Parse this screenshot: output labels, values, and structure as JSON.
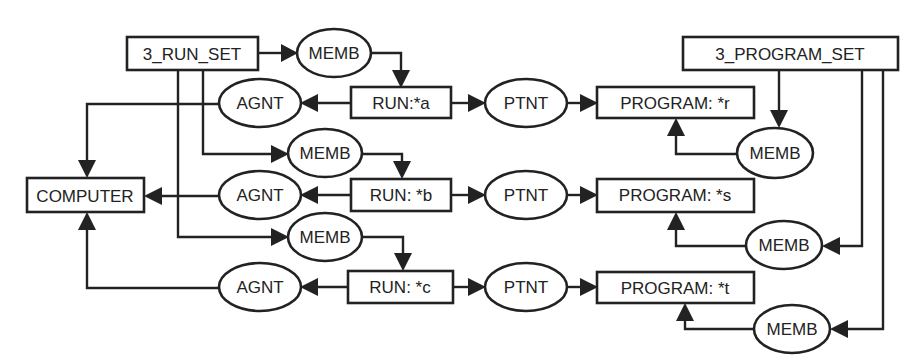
{
  "diagram": {
    "type": "conceptual-graph",
    "colors": {
      "ink": "#222222",
      "background": "#ffffff"
    },
    "concepts": {
      "run_set": "3_RUN_SET",
      "program_set": "3_PROGRAM_SET",
      "computer": "COMPUTER",
      "run_a": "RUN:*a",
      "run_b": "RUN: *b",
      "run_c": "RUN: *c",
      "program_r": "PROGRAM: *r",
      "program_s": "PROGRAM: *s",
      "program_t": "PROGRAM: *t"
    },
    "relations": {
      "memb_run_a": "MEMB",
      "memb_run_b": "MEMB",
      "memb_run_c": "MEMB",
      "agnt_a": "AGNT",
      "agnt_b": "AGNT",
      "agnt_c": "AGNT",
      "ptnt_a": "PTNT",
      "ptnt_b": "PTNT",
      "ptnt_c": "PTNT",
      "memb_prog_r": "MEMB",
      "memb_prog_s": "MEMB",
      "memb_prog_t": "MEMB"
    },
    "edges": [
      {
        "from": "3_RUN_SET",
        "to": "MEMB(a)"
      },
      {
        "from": "MEMB(a)",
        "to": "RUN:*a"
      },
      {
        "from": "3_RUN_SET",
        "to": "MEMB(b)"
      },
      {
        "from": "MEMB(b)",
        "to": "RUN: *b"
      },
      {
        "from": "3_RUN_SET",
        "to": "MEMB(c)"
      },
      {
        "from": "MEMB(c)",
        "to": "RUN: *c"
      },
      {
        "from": "RUN:*a",
        "to": "AGNT(a)"
      },
      {
        "from": "AGNT(a)",
        "to": "COMPUTER"
      },
      {
        "from": "RUN: *b",
        "to": "AGNT(b)"
      },
      {
        "from": "AGNT(b)",
        "to": "COMPUTER"
      },
      {
        "from": "RUN: *c",
        "to": "AGNT(c)"
      },
      {
        "from": "AGNT(c)",
        "to": "COMPUTER"
      },
      {
        "from": "RUN:*a",
        "to": "PTNT(a)"
      },
      {
        "from": "PTNT(a)",
        "to": "PROGRAM: *r"
      },
      {
        "from": "RUN: *b",
        "to": "PTNT(b)"
      },
      {
        "from": "PTNT(b)",
        "to": "PROGRAM: *s"
      },
      {
        "from": "RUN: *c",
        "to": "PTNT(c)"
      },
      {
        "from": "PTNT(c)",
        "to": "PROGRAM: *t"
      },
      {
        "from": "3_PROGRAM_SET",
        "to": "MEMB(r)"
      },
      {
        "from": "MEMB(r)",
        "to": "PROGRAM: *r"
      },
      {
        "from": "3_PROGRAM_SET",
        "to": "MEMB(s)"
      },
      {
        "from": "MEMB(s)",
        "to": "PROGRAM: *s"
      },
      {
        "from": "3_PROGRAM_SET",
        "to": "MEMB(t)"
      },
      {
        "from": "MEMB(t)",
        "to": "PROGRAM: *t"
      }
    ]
  }
}
